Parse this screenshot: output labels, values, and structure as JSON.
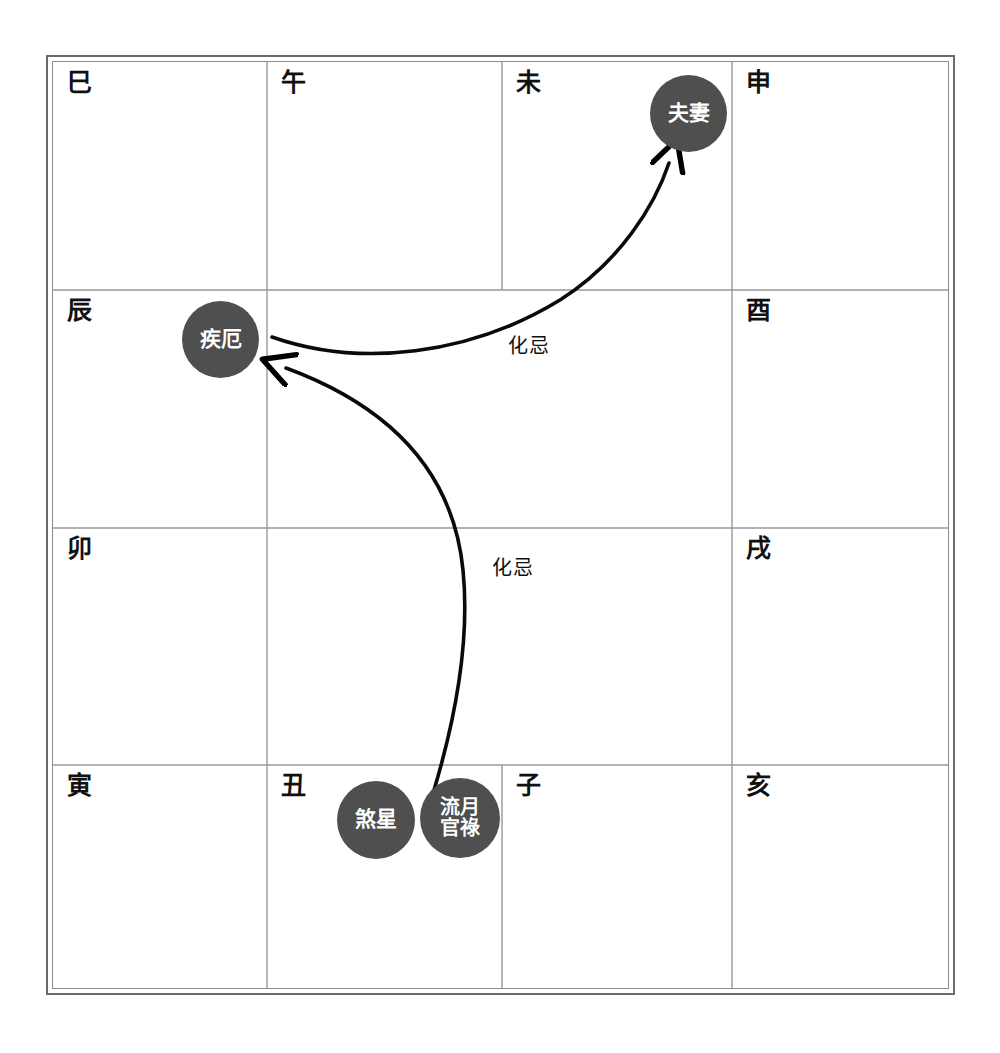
{
  "diagram": {
    "grid": {
      "columns": 4,
      "rows": 4,
      "center_merged": true
    },
    "cells": [
      {
        "id": "si",
        "label": "巳",
        "row": 1,
        "col": 1
      },
      {
        "id": "wu",
        "label": "午",
        "row": 1,
        "col": 2
      },
      {
        "id": "wei",
        "label": "未",
        "row": 1,
        "col": 3
      },
      {
        "id": "shen",
        "label": "申",
        "row": 1,
        "col": 4
      },
      {
        "id": "chen",
        "label": "辰",
        "row": 2,
        "col": 1
      },
      {
        "id": "you",
        "label": "酉",
        "row": 2,
        "col": 4
      },
      {
        "id": "mao",
        "label": "卯",
        "row": 3,
        "col": 1
      },
      {
        "id": "xu",
        "label": "戌",
        "row": 3,
        "col": 4
      },
      {
        "id": "yin",
        "label": "寅",
        "row": 4,
        "col": 1
      },
      {
        "id": "chou",
        "label": "丑",
        "row": 4,
        "col": 2
      },
      {
        "id": "zi",
        "label": "子",
        "row": 4,
        "col": 3
      },
      {
        "id": "hai",
        "label": "亥",
        "row": 4,
        "col": 4
      }
    ],
    "stars": [
      {
        "id": "fuqi",
        "label": "夫妻",
        "cell": "wei",
        "lines": 1,
        "color": "#4f4f4f"
      },
      {
        "id": "jie",
        "label": "疾厄",
        "cell": "chen",
        "lines": 1,
        "color": "#4f4f4f"
      },
      {
        "id": "shaxing",
        "label": "煞星",
        "cell": "chou",
        "lines": 1,
        "color": "#4f4f4f"
      },
      {
        "id": "liuyueguanlu",
        "label": "流月\n官祿",
        "cell": "chou",
        "lines": 2,
        "color": "#4f4f4f"
      }
    ],
    "flows": [
      {
        "id": "flow-jie-to-fuqi",
        "label": "化忌",
        "from": "疾厄",
        "to": "夫妻"
      },
      {
        "id": "flow-shaxing-to-jie",
        "label": "化忌",
        "from": "流月官祿",
        "to": "疾厄"
      }
    ],
    "colors": {
      "star_fill": "#4f4f4f",
      "star_text": "#ffffff",
      "frame_outer": "#6b6b6b",
      "frame_inner": "#8c8c8c",
      "grid_line": "#999999",
      "text": "#111111",
      "arrow": "#000000",
      "background": "#ffffff"
    }
  }
}
